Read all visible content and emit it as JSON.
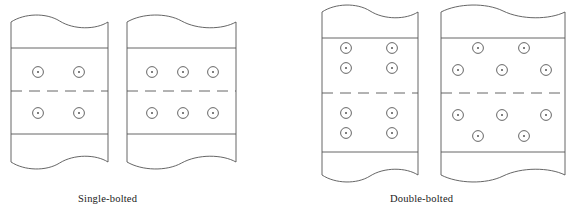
{
  "figure": {
    "background_color": "#ffffff",
    "line_color": "#555555",
    "bolt_color": "#555555",
    "text_color": "#1a1a1a"
  },
  "captions": {
    "single": "Single-bolted",
    "double": "Double-bolted"
  },
  "geometry": {
    "stroke_width": 0.9,
    "bolt_outer_radius": 5.4,
    "bolt_inner_radius": 1.0,
    "dash_pattern": "11 7"
  },
  "panels": [
    {
      "id": "single-left",
      "group": "Single-bolted",
      "label": "left plate",
      "x_left": 11,
      "x_right": 108,
      "y_top": 22,
      "y_bottom": 162,
      "edge_line_top_y": 48,
      "edge_line_bottom_y": 134,
      "centerline_y": 91,
      "break_top": true,
      "break_bottom": true,
      "bolt_rows": [
        {
          "y": 72,
          "xs": [
            38,
            79
          ]
        },
        {
          "y": 113,
          "xs": [
            38,
            79
          ]
        }
      ],
      "bolt_count": 4,
      "rows_per_half": 1,
      "columns": 2
    },
    {
      "id": "single-right",
      "group": "Single-bolted",
      "label": "right plate",
      "x_left": 127,
      "x_right": 236,
      "y_top": 22,
      "y_bottom": 162,
      "edge_line_top_y": 48,
      "edge_line_bottom_y": 134,
      "centerline_y": 91,
      "break_top": true,
      "break_bottom": true,
      "bolt_rows": [
        {
          "y": 72,
          "xs": [
            152,
            183,
            213
          ]
        },
        {
          "y": 113,
          "xs": [
            152,
            183,
            213
          ]
        }
      ],
      "bolt_count": 6,
      "rows_per_half": 1,
      "columns": 3
    },
    {
      "id": "double-left",
      "group": "Double-bolted",
      "label": "left plate",
      "x_left": 322,
      "x_right": 418,
      "y_top": 12,
      "y_bottom": 175,
      "edge_line_top_y": 38,
      "edge_line_bottom_y": 152,
      "centerline_y": 93,
      "break_top": true,
      "break_bottom": true,
      "bolt_rows": [
        {
          "y": 48,
          "xs": [
            346,
            392
          ]
        },
        {
          "y": 68,
          "xs": [
            346,
            392
          ]
        },
        {
          "y": 113,
          "xs": [
            346,
            392
          ]
        },
        {
          "y": 133,
          "xs": [
            346,
            392
          ]
        }
      ],
      "bolt_count": 8,
      "rows_per_half": 2,
      "columns": 2
    },
    {
      "id": "double-right",
      "group": "Double-bolted",
      "label": "right plate",
      "x_left": 441,
      "x_right": 565,
      "y_top": 12,
      "y_bottom": 175,
      "edge_line_top_y": 38,
      "edge_line_bottom_y": 152,
      "centerline_y": 93,
      "break_top": true,
      "break_bottom": true,
      "staggered": true,
      "bolt_rows": [
        {
          "y": 48,
          "xs": [
            478,
            524
          ]
        },
        {
          "y": 70,
          "xs": [
            458,
            502,
            546
          ]
        },
        {
          "y": 115,
          "xs": [
            458,
            502,
            546
          ]
        },
        {
          "y": 136,
          "xs": [
            478,
            524
          ]
        }
      ],
      "bolt_count": 10,
      "rows_per_half": 2,
      "columns": 3
    }
  ]
}
